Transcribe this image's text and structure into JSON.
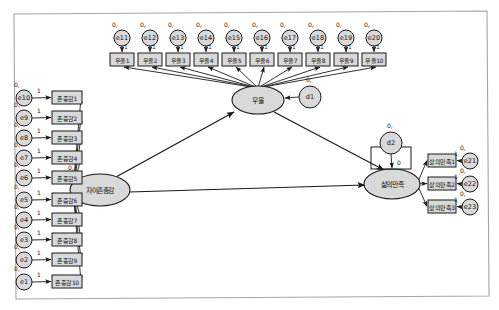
{
  "diagram": {
    "software_style": "amos-path-diagram",
    "canvas": {
      "width": 499,
      "height": 310,
      "background": "#ffffff",
      "border_color": "#9a9a9a"
    },
    "colors": {
      "shape_fill": "#d9d9d9",
      "shape_stroke": "#1a1a1a",
      "arrow": "#1a1a1a",
      "text": "#111111"
    },
    "legend_note": "",
    "latent_variables": [
      {
        "id": "selfesteem",
        "label": "자아존중감",
        "shape": "ellipse",
        "cx": 100,
        "cy": 190,
        "rx": 30,
        "ry": 16,
        "variance_label": "0,"
      },
      {
        "id": "depression",
        "label": "우울",
        "shape": "ellipse",
        "cx": 258,
        "cy": 100,
        "rx": 26,
        "ry": 14,
        "variance_label": ""
      },
      {
        "id": "lifesat",
        "label": "삶의만족",
        "shape": "ellipse",
        "cx": 392,
        "cy": 184,
        "rx": 28,
        "ry": 15,
        "variance_label": ""
      }
    ],
    "disturbances": [
      {
        "id": "d1",
        "label": "d1",
        "cx": 310,
        "cy": 97,
        "r": 11,
        "variance_label": "0,",
        "target": "depression"
      },
      {
        "id": "d2",
        "label": "d2",
        "cx": 391,
        "cy": 143,
        "r": 11,
        "variance_label": "0,",
        "target": "lifesat",
        "coef": "0"
      }
    ],
    "indicator_groups": [
      {
        "name": "depression-indicators",
        "latent": "depression",
        "orientation": "top-row",
        "items": [
          {
            "error": "e11",
            "indicator": "우울1",
            "error_cx": 122,
            "error_cy": 38,
            "box_x": 110,
            "box_y": 53,
            "coef": "1",
            "zero": "0,"
          },
          {
            "error": "e12",
            "indicator": "우울2",
            "error_cx": 150,
            "error_cy": 38,
            "box_x": 138,
            "box_y": 53,
            "coef": "1",
            "zero": "0,"
          },
          {
            "error": "e13",
            "indicator": "우울3",
            "error_cx": 178,
            "error_cy": 38,
            "box_x": 166,
            "box_y": 53,
            "coef": "1",
            "zero": "0,"
          },
          {
            "error": "e14",
            "indicator": "우울4",
            "error_cx": 206,
            "error_cy": 38,
            "box_x": 194,
            "box_y": 53,
            "coef": "1",
            "zero": "0,"
          },
          {
            "error": "e15",
            "indicator": "우울5",
            "error_cx": 234,
            "error_cy": 38,
            "box_x": 222,
            "box_y": 53,
            "coef": "1",
            "zero": "0,"
          },
          {
            "error": "e16",
            "indicator": "우울6",
            "error_cx": 262,
            "error_cy": 38,
            "box_x": 250,
            "box_y": 53,
            "coef": "1",
            "zero": "0,"
          },
          {
            "error": "e17",
            "indicator": "우울7",
            "error_cx": 290,
            "error_cy": 38,
            "box_x": 278,
            "box_y": 53,
            "coef": "1",
            "zero": "0,"
          },
          {
            "error": "e18",
            "indicator": "우울8",
            "error_cx": 318,
            "error_cy": 38,
            "box_x": 306,
            "box_y": 53,
            "coef": "1",
            "zero": "0,"
          },
          {
            "error": "e19",
            "indicator": "우울9",
            "error_cx": 346,
            "error_cy": 38,
            "box_x": 334,
            "box_y": 53,
            "coef": "1",
            "zero": "0,"
          },
          {
            "error": "e20",
            "indicator": "우울10",
            "error_cx": 374,
            "error_cy": 38,
            "box_x": 362,
            "box_y": 53,
            "coef": "1",
            "zero": "0,"
          }
        ]
      },
      {
        "name": "selfesteem-indicators",
        "latent": "selfesteem",
        "orientation": "left-column",
        "items": [
          {
            "error": "e10",
            "indicator": "존중감1",
            "error_cx": 24,
            "error_cy": 98,
            "box_x": 52,
            "box_y": 91,
            "coef": "1",
            "zero": "0,"
          },
          {
            "error": "e9",
            "indicator": "존중감2",
            "error_cx": 24,
            "error_cy": 118,
            "box_x": 52,
            "box_y": 111,
            "coef": "1",
            "zero": "0,"
          },
          {
            "error": "e8",
            "indicator": "존중감3",
            "error_cx": 24,
            "error_cy": 138,
            "box_x": 52,
            "box_y": 131,
            "coef": "1",
            "zero": "0,"
          },
          {
            "error": "e7",
            "indicator": "존중감4",
            "error_cx": 24,
            "error_cy": 158,
            "box_x": 52,
            "box_y": 151,
            "coef": "1",
            "zero": "0,"
          },
          {
            "error": "e6",
            "indicator": "존중감5",
            "error_cx": 24,
            "error_cy": 178,
            "box_x": 52,
            "box_y": 171,
            "coef": "1",
            "zero": "0,"
          },
          {
            "error": "e5",
            "indicator": "존중감6",
            "error_cx": 24,
            "error_cy": 200,
            "box_x": 52,
            "box_y": 193,
            "coef": "1",
            "zero": "0,"
          },
          {
            "error": "e4",
            "indicator": "존중감7",
            "error_cx": 24,
            "error_cy": 220,
            "box_x": 52,
            "box_y": 213,
            "coef": "1",
            "zero": "0,"
          },
          {
            "error": "e3",
            "indicator": "존중감8",
            "error_cx": 24,
            "error_cy": 240,
            "box_x": 52,
            "box_y": 233,
            "coef": "1",
            "zero": "0,"
          },
          {
            "error": "e2",
            "indicator": "존중감9",
            "error_cx": 24,
            "error_cy": 260,
            "box_x": 52,
            "box_y": 253,
            "coef": "1",
            "zero": "0,"
          },
          {
            "error": "e1",
            "indicator": "존중감10",
            "error_cx": 24,
            "error_cy": 282,
            "box_x": 52,
            "box_y": 275,
            "coef": "1",
            "zero": "0,"
          }
        ]
      },
      {
        "name": "lifesat-indicators",
        "latent": "lifesat",
        "orientation": "right-column",
        "items": [
          {
            "error": "e21",
            "indicator": "삶의만족1",
            "error_cx": 470,
            "error_cy": 161,
            "box_x": 428,
            "box_y": 154,
            "coef": "1",
            "zero": "0,"
          },
          {
            "error": "e22",
            "indicator": "삶의만족2",
            "error_cx": 470,
            "error_cy": 184,
            "box_x": 428,
            "box_y": 177,
            "coef": "1",
            "zero": "0,"
          },
          {
            "error": "e23",
            "indicator": "삶의만족3",
            "error_cx": 470,
            "error_cy": 207,
            "box_x": 428,
            "box_y": 200,
            "coef": "1",
            "zero": "0,"
          }
        ]
      }
    ],
    "structural_paths": [
      {
        "from": "selfesteem",
        "to": "depression",
        "label": ""
      },
      {
        "from": "selfesteem",
        "to": "lifesat",
        "label": ""
      },
      {
        "from": "depression",
        "to": "lifesat",
        "label": ""
      }
    ]
  }
}
